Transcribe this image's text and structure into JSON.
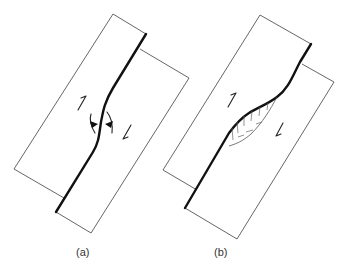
{
  "figure": {
    "panels": [
      {
        "id": "a",
        "label": "(a)",
        "sense_of_shear": "sinistral",
        "features": [
          "left block",
          "right block",
          "curved fault",
          "half-arrow up-left block",
          "half-arrow down-right block",
          "compression arrows at bend"
        ]
      },
      {
        "id": "b",
        "label": "(b)",
        "sense_of_shear": "sinistral",
        "features": [
          "left block",
          "right block",
          "curved fault",
          "hatched lens-shaped basin",
          "half-arrow up-left block",
          "half-arrow down-right block"
        ]
      }
    ]
  },
  "colors": {
    "background": "#ffffff",
    "fault": "#111111",
    "block_outline": "#555555"
  }
}
